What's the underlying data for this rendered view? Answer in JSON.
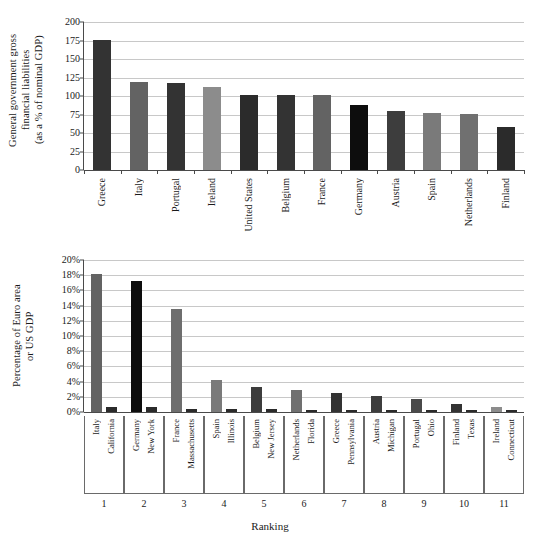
{
  "chart_data": [
    {
      "type": "bar",
      "title": "",
      "panel": "top",
      "ylabel": "General government gross\nfinancial liabilities\n(as a % of nominal GDP)",
      "xlabel": "",
      "ylim": [
        0,
        200
      ],
      "yticks": [
        0,
        25,
        50,
        75,
        100,
        125,
        150,
        175,
        200
      ],
      "ytick_labels": [
        "0",
        "25",
        "50",
        "75",
        "100",
        "125",
        "150",
        "175",
        "200"
      ],
      "grid": true,
      "legend": "none",
      "categories": [
        "Greece",
        "Italy",
        "Portugal",
        "Ireland",
        "United States",
        "Belgium",
        "France",
        "Germany",
        "Austria",
        "Spain",
        "Netherlands",
        "Finland"
      ],
      "values": [
        176,
        119,
        118,
        112,
        102,
        101,
        101,
        88,
        80,
        77,
        76,
        58
      ],
      "bar_colors": [
        "#333333",
        "#636363",
        "#333333",
        "#8c8c8c",
        "#2b2b2b",
        "#333333",
        "#636363",
        "#0d0d0d",
        "#3d3d3d",
        "#7a7a7a",
        "#707070",
        "#2b2b2b"
      ]
    },
    {
      "type": "bar",
      "title": "",
      "panel": "bottom",
      "ylabel": "Percentage of Euro area\nor US GDP",
      "xlabel": "Ranking",
      "ylim": [
        0,
        20
      ],
      "yticks": [
        0,
        2,
        4,
        6,
        8,
        10,
        12,
        14,
        16,
        18,
        20
      ],
      "ytick_labels": [
        "0%",
        "2%",
        "4%",
        "6%",
        "8%",
        "10%",
        "12%",
        "14%",
        "16%",
        "18%",
        "20%"
      ],
      "grid": true,
      "legend": "none",
      "categories": [
        "1",
        "2",
        "3",
        "4",
        "5",
        "6",
        "7",
        "8",
        "9",
        "10",
        "11"
      ],
      "group_labels": [
        {
          "euro": "Italy",
          "us": "California"
        },
        {
          "euro": "Germany",
          "us": "New York"
        },
        {
          "euro": "France",
          "us": "Massachusetts"
        },
        {
          "euro": "Spain",
          "us": "Illinois"
        },
        {
          "euro": "Belgium",
          "us": "New Jersey"
        },
        {
          "euro": "Netherlands",
          "us": "Florida"
        },
        {
          "euro": "Greece",
          "us": "Pennsylvania"
        },
        {
          "euro": "Austria",
          "us": "Michigan"
        },
        {
          "euro": "Portugal",
          "us": "Ohio"
        },
        {
          "euro": "Finland",
          "us": "Texas"
        },
        {
          "euro": "Ireland",
          "us": "Connecticut"
        }
      ],
      "series": [
        {
          "name": "Euro area country (% of Euro area GDP)",
          "values": [
            18.1,
            17.3,
            13.6,
            4.15,
            3.3,
            2.9,
            2.55,
            2.1,
            1.75,
            1.0,
            0.6
          ],
          "colors": [
            "#636363",
            "#0d0d0d",
            "#6e6e6e",
            "#7a7a7a",
            "#3d3d3d",
            "#707070",
            "#333333",
            "#3d3d3d",
            "#4a4a4a",
            "#333333",
            "#8c8c8c"
          ]
        },
        {
          "name": "US state (% of US GDP)",
          "values": [
            0.7,
            0.7,
            0.4,
            0.35,
            0.35,
            0.3,
            0.3,
            0.22,
            0.2,
            0.2,
            0.2
          ],
          "colors": [
            "#2b2b2b",
            "#2b2b2b",
            "#2b2b2b",
            "#2b2b2b",
            "#2b2b2b",
            "#2b2b2b",
            "#2b2b2b",
            "#2b2b2b",
            "#2b2b2b",
            "#2b2b2b",
            "#2b2b2b"
          ]
        }
      ]
    }
  ]
}
